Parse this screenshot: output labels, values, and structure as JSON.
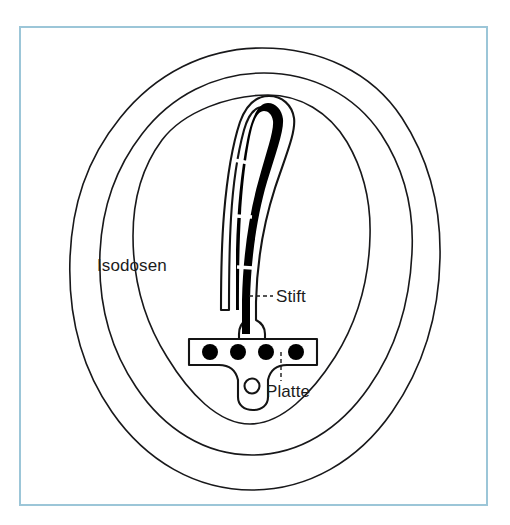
{
  "figure": {
    "background_color": "#ffffff",
    "frame": {
      "color": "#9cc6d8",
      "x": 20,
      "y": 27,
      "width": 467,
      "height": 478
    },
    "labels": {
      "isodosen": "Isodosen",
      "stift": "Stift",
      "platte": "Platte"
    },
    "label_color": "#1c1c1c",
    "line_color": "#18181a",
    "rod_color": "#000000",
    "contours": {
      "count": 3,
      "names": [
        "isodose-outer",
        "isodose-middle",
        "isodose-inner"
      ]
    },
    "implant": {
      "rod_segments": 4,
      "screw_holes_filled": 4,
      "screw_holes_open": 1
    }
  }
}
